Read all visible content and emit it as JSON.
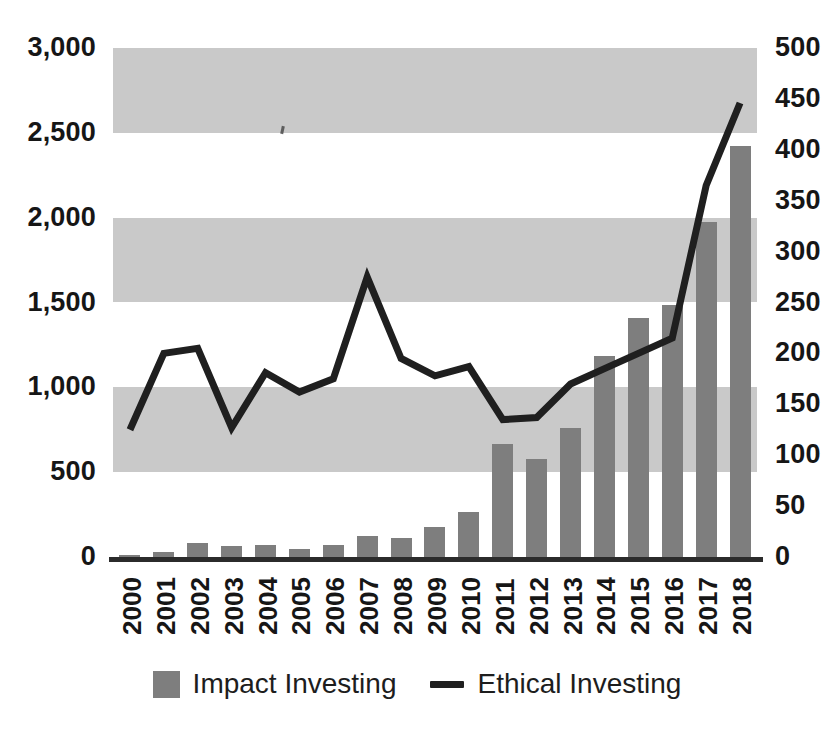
{
  "chart_data": {
    "type": "bar",
    "title": "",
    "subtitle": "",
    "xlabel": "",
    "ylabel": "",
    "categories": [
      "2000",
      "2001",
      "2002",
      "2003",
      "2004",
      "2005",
      "2006",
      "2007",
      "2008",
      "2009",
      "2010",
      "2011",
      "2012",
      "2013",
      "2014",
      "2015",
      "2016",
      "2017",
      "2018"
    ],
    "series": [
      {
        "name": "Impact Investing",
        "type": "bar",
        "axis": "left",
        "color": "#7e7e7e",
        "values": [
          12,
          30,
          85,
          65,
          68,
          50,
          72,
          125,
          112,
          175,
          265,
          665,
          577,
          760,
          1185,
          1408,
          1485,
          1975,
          2420
        ]
      },
      {
        "name": "Ethical Investing",
        "type": "line",
        "axis": "right",
        "color": "#1f1f1f",
        "values": [
          125,
          200,
          205,
          127,
          181,
          162,
          175,
          275,
          195,
          178,
          187,
          135,
          137,
          170,
          185,
          200,
          215,
          365,
          446
        ]
      }
    ],
    "left_axis": {
      "ticks": [
        "0",
        "500",
        "1,000",
        "1,500",
        "2,000",
        "2,500",
        "3,000"
      ],
      "values": [
        0,
        500,
        1000,
        1500,
        2000,
        2500,
        3000
      ],
      "min": 0,
      "max": 3000
    },
    "right_axis": {
      "ticks": [
        "0",
        "50",
        "100",
        "150",
        "200",
        "250",
        "300",
        "350",
        "400",
        "450",
        "500"
      ],
      "values": [
        0,
        50,
        100,
        150,
        200,
        250,
        300,
        350,
        400,
        450,
        500
      ],
      "min": 0,
      "max": 500
    },
    "grid": {
      "alternating_bands": true,
      "band_color": "#c9c9c9",
      "background": "#ffffff"
    },
    "legend": {
      "position": "bottom",
      "entries": [
        {
          "label": "Impact Investing",
          "marker": "square",
          "color": "#7e7e7e"
        },
        {
          "label": "Ethical Investing",
          "marker": "line",
          "color": "#1f1f1f"
        }
      ]
    }
  }
}
